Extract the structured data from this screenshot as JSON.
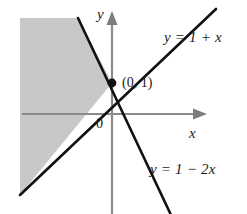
{
  "figure": {
    "type": "math-graph",
    "width": 247,
    "height": 214,
    "background_color": "#ffffff",
    "shaded_region_color": "#c8c8c8",
    "line_color": "#111111",
    "axis_color": "#8a8a8a"
  },
  "axes": {
    "x_label": "x",
    "y_label": "y",
    "origin_label": "0",
    "x_axis_pixel_y": 114,
    "y_axis_pixel_x": 112,
    "x_arrow_tip_pixel_x": 205,
    "y_arrow_tip_pixel_y": 14
  },
  "lines": [
    {
      "name": "line-ascending",
      "label": "y = 1 + x",
      "slope": 1,
      "intercept": 1,
      "label_position": "upper-right"
    },
    {
      "name": "line-descending",
      "label": "y = 1 − 2x",
      "slope": -2,
      "intercept": 1,
      "label_position": "lower-right"
    }
  ],
  "points": [
    {
      "name": "intersection-point",
      "label": "(0, 1)",
      "x": 0,
      "y": 1,
      "pixel_x": 112,
      "pixel_y": 83,
      "marker": "filled-dot"
    }
  ],
  "shaded_region": {
    "name": "solution-region",
    "description": "Wedge between the two lines opening toward the left of the intersection point",
    "bounded_above_by": "y = 1 − 2x",
    "bounded_below_by": "y = 1 + x",
    "fill_color": "#c8c8c8"
  }
}
